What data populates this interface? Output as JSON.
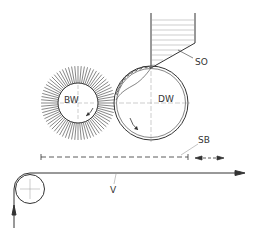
{
  "diagram": {
    "type": "coating-apparatus-schematic",
    "labels": {
      "brush_roller": "BW",
      "doctor_roller": "DW",
      "hopper": "SO",
      "shield_bar": "SB",
      "web": "V"
    },
    "colors": {
      "line": "#333333",
      "background": "#ffffff"
    },
    "components": [
      {
        "id": "hopper",
        "label": "SO",
        "description": "Coating fluid hopper feeding onto DW roller"
      },
      {
        "id": "brush-roller",
        "label": "BW",
        "description": "Brush roller with radial bristles, counter-rotating"
      },
      {
        "id": "doctor-roller",
        "label": "DW",
        "description": "Roller with fluid film, rotating"
      },
      {
        "id": "shield-bar",
        "label": "SB",
        "description": "Dashed adjustable bar with bidirectional arrow"
      },
      {
        "id": "web",
        "label": "V",
        "description": "Web travelling left to right around guide roller"
      }
    ]
  }
}
